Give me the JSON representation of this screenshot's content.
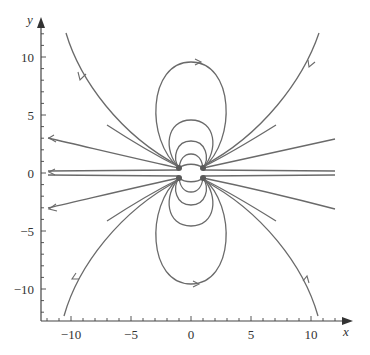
{
  "chart_data": {
    "type": "line",
    "title": "",
    "xlabel": "x",
    "ylabel": "y",
    "xlim": [
      -12.5,
      13.5
    ],
    "ylim": [
      -12.8,
      13.5
    ],
    "grid": false,
    "x_ticks": [
      -10,
      -5,
      0,
      5,
      10
    ],
    "x_tick_labels": [
      "−10",
      "−5",
      "0",
      "5",
      "10"
    ],
    "y_ticks": [
      10,
      5,
      0,
      -5,
      -10
    ],
    "y_tick_labels": [
      "10",
      "5",
      "0",
      "−5",
      "−10"
    ],
    "line_color": "#6a6a6a",
    "series": [
      {
        "name": "outer-top-left",
        "points": [
          [
            -10.4,
            12.0
          ],
          [
            -8.5,
            8.5
          ],
          [
            -5,
            4.5
          ],
          [
            -2,
            2.0
          ],
          [
            -1,
            0.5
          ]
        ]
      },
      {
        "name": "outer-top-right",
        "points": [
          [
            10.6,
            12.0
          ],
          [
            8.5,
            8.5
          ],
          [
            5,
            4.5
          ],
          [
            2,
            2.0
          ],
          [
            1,
            0.5
          ]
        ]
      },
      {
        "name": "outer-bottom-left",
        "points": [
          [
            -10.6,
            -12.0
          ],
          [
            -8.5,
            -8.5
          ],
          [
            -5,
            -4.5
          ],
          [
            -2,
            -2.0
          ],
          [
            -1,
            -0.5
          ]
        ]
      },
      {
        "name": "outer-bottom-right",
        "points": [
          [
            10.6,
            -12.0
          ],
          [
            8.5,
            -8.5
          ],
          [
            5,
            -4.5
          ],
          [
            2,
            -2.0
          ],
          [
            1,
            -0.5
          ]
        ]
      },
      {
        "name": "side-upper-left",
        "points": [
          [
            -12,
            3.0
          ],
          [
            -6,
            1.8
          ],
          [
            -1,
            0.4
          ]
        ]
      },
      {
        "name": "side-upper-right",
        "points": [
          [
            12,
            2.8
          ],
          [
            6,
            1.8
          ],
          [
            1,
            0.4
          ]
        ]
      },
      {
        "name": "side-lower-left",
        "points": [
          [
            -12,
            -3.0
          ],
          [
            -6,
            -1.8
          ],
          [
            -1,
            -0.4
          ]
        ]
      },
      {
        "name": "side-lower-right",
        "points": [
          [
            12,
            -3.0
          ],
          [
            6,
            -1.8
          ],
          [
            1,
            -0.4
          ]
        ]
      },
      {
        "name": "axis-near-left",
        "points": [
          [
            -12,
            0.25
          ],
          [
            -1,
            0.2
          ]
        ]
      },
      {
        "name": "axis-near-right",
        "points": [
          [
            12,
            0.25
          ],
          [
            1,
            0.2
          ]
        ]
      },
      {
        "name": "loop-top-large",
        "points": [
          [
            -1,
            0.4
          ],
          [
            -3.3,
            4
          ],
          [
            -2,
            9.5
          ],
          [
            0,
            10
          ],
          [
            2,
            9.5
          ],
          [
            3.3,
            4
          ],
          [
            1,
            0.4
          ]
        ]
      },
      {
        "name": "loop-top-medium",
        "points": [
          [
            -1,
            0.4
          ],
          [
            -1.9,
            2.5
          ],
          [
            0,
            4
          ],
          [
            1.9,
            2.5
          ],
          [
            1,
            0.4
          ]
        ]
      },
      {
        "name": "loop-top-small",
        "points": [
          [
            -1,
            0.4
          ],
          [
            -1.2,
            1.5
          ],
          [
            0,
            2.3
          ],
          [
            1.2,
            1.5
          ],
          [
            1,
            0.4
          ]
        ]
      },
      {
        "name": "loop-bottom-large",
        "points": [
          [
            -1,
            -0.4
          ],
          [
            -3.3,
            -4
          ],
          [
            -2,
            -9.5
          ],
          [
            0,
            -10
          ],
          [
            2,
            -9.5
          ],
          [
            3.3,
            -4
          ],
          [
            1,
            -0.4
          ]
        ]
      },
      {
        "name": "loop-bottom-medium",
        "points": [
          [
            -1,
            -0.4
          ],
          [
            -1.9,
            -2.5
          ],
          [
            0,
            -4
          ],
          [
            1.9,
            -2.5
          ],
          [
            1,
            -0.4
          ]
        ]
      },
      {
        "name": "loop-bottom-small",
        "points": [
          [
            -1,
            -0.4
          ],
          [
            -1.2,
            -1.5
          ],
          [
            0,
            -2.3
          ],
          [
            1.2,
            -1.5
          ],
          [
            1,
            -0.4
          ]
        ]
      }
    ],
    "sources": [
      [
        -1,
        0.4
      ],
      [
        1,
        0.4
      ],
      [
        -1,
        -0.4
      ],
      [
        1,
        -0.4
      ]
    ]
  }
}
